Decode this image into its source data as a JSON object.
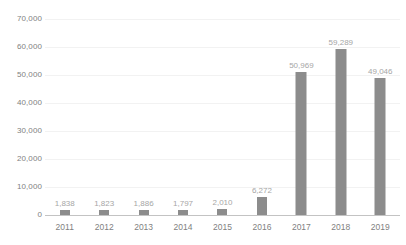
{
  "chart_data": {
    "type": "bar",
    "title": "",
    "subtitle": "",
    "xlabel": "",
    "ylabel": "",
    "categories": [
      "2011",
      "2012",
      "2013",
      "2014",
      "2015",
      "2016",
      "2017",
      "2018",
      "2019"
    ],
    "values": [
      1838,
      1823,
      1886,
      1797,
      2010,
      6272,
      50969,
      59289,
      49046
    ],
    "value_labels": [
      "1,838",
      "1,823",
      "1,886",
      "1,797",
      "2,010",
      "6,272",
      "50,969",
      "59,289",
      "49,046"
    ],
    "ylim": [
      0,
      70000
    ],
    "y_ticks": [
      0,
      10000,
      20000,
      30000,
      40000,
      50000,
      60000,
      70000
    ],
    "y_tick_labels": [
      "0",
      "10,000",
      "20,000",
      "30,000",
      "40,000",
      "50,000",
      "60,000",
      "70,000"
    ],
    "grid": true,
    "grid_axis": "y",
    "legend": false,
    "legend_position": "none",
    "data_labels_shown": true,
    "series": [
      {
        "name": "",
        "values": [
          1838,
          1823,
          1886,
          1797,
          2010,
          6272,
          50969,
          59289,
          49046
        ]
      }
    ],
    "colors": {
      "bar": "#8c8c8c",
      "gridline": "#f2f2f2",
      "axis_line": "#c3c3c3",
      "tick_label": "#7f7f7f",
      "data_label": "#a6a6a6",
      "background": "#ffffff"
    }
  }
}
